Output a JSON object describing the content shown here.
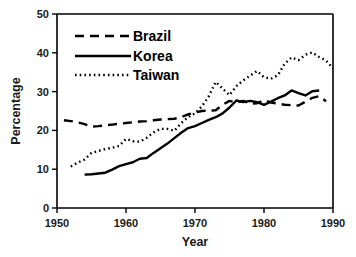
{
  "chart_data": {
    "type": "line",
    "title": "",
    "xlabel": "Year",
    "ylabel": "Percentage",
    "xlim": [
      1950,
      1990
    ],
    "ylim": [
      0,
      50
    ],
    "xticks": [
      1950,
      1960,
      1970,
      1980,
      1990
    ],
    "yticks": [
      0,
      10,
      20,
      30,
      40,
      50
    ],
    "grid": false,
    "legend_position": "upper-left",
    "legend_entries": [
      {
        "name": "Brazil",
        "style": "dashed"
      },
      {
        "name": "Korea",
        "style": "solid"
      },
      {
        "name": "Taiwan",
        "style": "dotted"
      }
    ],
    "series": [
      {
        "name": "Brazil",
        "style": "dashed",
        "x": [
          1951,
          1952,
          1953,
          1954,
          1955,
          1956,
          1957,
          1958,
          1959,
          1960,
          1961,
          1962,
          1963,
          1964,
          1965,
          1966,
          1967,
          1968,
          1969,
          1970,
          1971,
          1972,
          1973,
          1974,
          1975,
          1976,
          1977,
          1978,
          1979,
          1980,
          1981,
          1982,
          1983,
          1984,
          1985,
          1986,
          1987,
          1988,
          1989
        ],
        "y": [
          22.6,
          22.4,
          22.1,
          21.6,
          21.0,
          21.1,
          21.3,
          21.5,
          21.7,
          21.9,
          22.1,
          22.3,
          22.4,
          22.6,
          22.8,
          22.9,
          23.0,
          23.4,
          24.1,
          24.6,
          25.0,
          25.1,
          25.2,
          26.6,
          27.6,
          27.2,
          27.6,
          26.9,
          27.0,
          27.8,
          27.2,
          26.9,
          26.6,
          26.5,
          26.4,
          27.4,
          28.4,
          28.8,
          27.5
        ]
      },
      {
        "name": "Korea",
        "style": "solid",
        "x": [
          1954,
          1955,
          1956,
          1957,
          1958,
          1959,
          1960,
          1961,
          1962,
          1963,
          1964,
          1965,
          1966,
          1967,
          1968,
          1969,
          1970,
          1971,
          1972,
          1973,
          1974,
          1975,
          1976,
          1977,
          1978,
          1979,
          1980,
          1981,
          1982,
          1983,
          1984,
          1985,
          1986,
          1987,
          1988
        ],
        "y": [
          8.6,
          8.7,
          8.9,
          9.1,
          9.9,
          10.8,
          11.3,
          11.8,
          12.7,
          12.9,
          14.2,
          15.4,
          16.6,
          18.0,
          19.4,
          20.6,
          21.1,
          21.9,
          22.7,
          23.4,
          24.4,
          25.9,
          27.7,
          27.3,
          27.6,
          27.3,
          26.6,
          27.4,
          28.3,
          29.0,
          30.3,
          29.6,
          29.0,
          30.1,
          30.3
        ]
      },
      {
        "name": "Taiwan",
        "style": "dotted",
        "x": [
          1952,
          1953,
          1954,
          1955,
          1956,
          1957,
          1958,
          1959,
          1960,
          1961,
          1962,
          1963,
          1964,
          1965,
          1966,
          1967,
          1968,
          1969,
          1970,
          1971,
          1972,
          1973,
          1974,
          1975,
          1976,
          1977,
          1978,
          1979,
          1980,
          1981,
          1982,
          1983,
          1984,
          1985,
          1986,
          1987,
          1988,
          1989,
          1990
        ],
        "y": [
          10.7,
          11.7,
          12.5,
          14.2,
          14.7,
          15.2,
          15.5,
          16.0,
          17.8,
          17.2,
          17.1,
          18.1,
          19.5,
          20.4,
          20.4,
          19.9,
          21.9,
          23.4,
          24.4,
          26.2,
          28.8,
          32.5,
          30.8,
          29.1,
          31.4,
          32.9,
          34.1,
          35.3,
          33.7,
          33.3,
          34.2,
          37.2,
          38.8,
          38.1,
          39.5,
          40.1,
          38.9,
          38.0,
          36.0
        ]
      }
    ]
  },
  "axes": {
    "ylabel": "Percentage",
    "xlabel": "Year",
    "ytick_labels": [
      "0",
      "10",
      "20",
      "30",
      "40",
      "50"
    ],
    "xtick_labels": [
      "1950",
      "1960",
      "1970",
      "1980",
      "1990"
    ]
  },
  "legend": {
    "items": [
      {
        "label": "Brazil"
      },
      {
        "label": "Korea"
      },
      {
        "label": "Taiwan"
      }
    ]
  },
  "colors": {
    "ink": "#000000",
    "background": "#ffffff"
  }
}
